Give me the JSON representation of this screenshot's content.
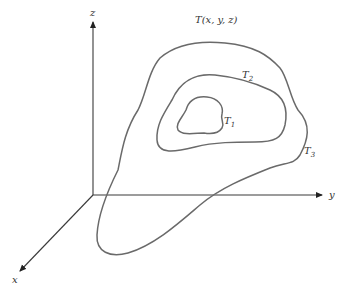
{
  "diagram": {
    "title_label": "T(x, y, z)",
    "axes": {
      "z": "z",
      "y": "y",
      "x": "x"
    },
    "contours": [
      {
        "id": "T1",
        "base": "T",
        "subscript": "1"
      },
      {
        "id": "T2",
        "base": "T",
        "subscript": "2"
      },
      {
        "id": "T3",
        "base": "T",
        "subscript": "3"
      }
    ],
    "colors": {
      "axis": "#3a3a3a",
      "contour": "#6a6a6a",
      "text": "#333333",
      "background": "#ffffff"
    }
  }
}
